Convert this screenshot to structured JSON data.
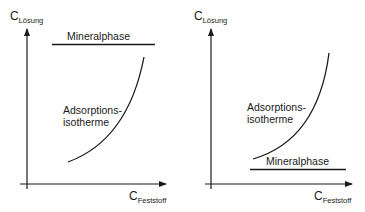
{
  "panels": [
    {
      "id": "left",
      "y_axis": {
        "symbol": "C",
        "subscript": "Lösung"
      },
      "x_axis": {
        "symbol": "C",
        "subscript": "Feststoff"
      },
      "mineral_label": "Mineralphase",
      "mineral_position": "above curve",
      "isotherm_label_line1": "Adsorptions-",
      "isotherm_label_line2": "isotherme"
    },
    {
      "id": "right",
      "y_axis": {
        "symbol": "C",
        "subscript": "Lösung"
      },
      "x_axis": {
        "symbol": "C",
        "subscript": "Feststoff"
      },
      "mineral_label": "Mineralphase",
      "mineral_position": "below curve",
      "isotherm_label_line1": "Adsorptions-",
      "isotherm_label_line2": "isotherme"
    }
  ],
  "colors": {
    "line": "#1a1a1a",
    "background": "#ffffff"
  }
}
